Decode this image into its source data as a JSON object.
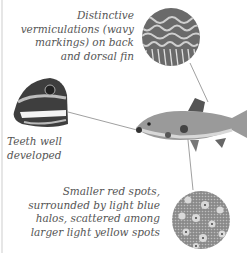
{
  "captions": {
    "vermiculations": [
      "Distinctive",
      "vermiculations (wavy",
      "markings) on back",
      "and dorsal fin"
    ],
    "teeth": [
      "Teeth well",
      "developed"
    ],
    "spots": [
      "Smaller red spots,",
      "surrounded by light blue",
      "halos, scattered among",
      "larger light yellow spots"
    ]
  },
  "colors": {
    "caption": "#555555",
    "leader_line": "#666666",
    "background": "#ffffff"
  }
}
